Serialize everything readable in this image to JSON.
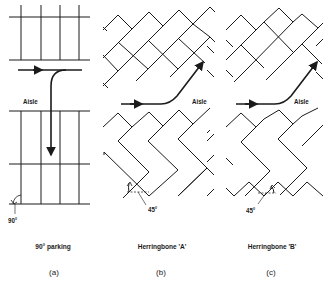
{
  "diagram": {
    "ink_color": "#1a1a1a",
    "panels": [
      {
        "id": "a",
        "caption": "90° parking",
        "sub_label": "(a)",
        "aisle_label": "Aisle",
        "angle_label": "90°"
      },
      {
        "id": "b",
        "caption": "Herringbone 'A'",
        "sub_label": "(b)",
        "aisle_label": "Aisle",
        "angle_label": "45°"
      },
      {
        "id": "c",
        "caption": "Herringbone 'B'",
        "sub_label": "(c)",
        "aisle_label": "Aisle",
        "angle_label": "45°"
      }
    ]
  }
}
